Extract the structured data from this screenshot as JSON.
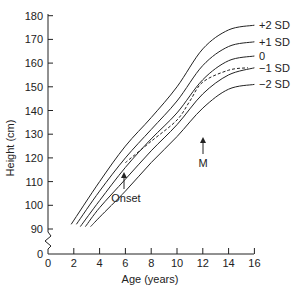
{
  "chart_data": {
    "type": "line",
    "title": "",
    "xlabel": "Age (years)",
    "ylabel": "Height (cm)",
    "xlim": [
      0,
      16
    ],
    "ylim": [
      90,
      180
    ],
    "y_axis_break": true,
    "y_zero_label": "0",
    "x_ticks": [
      0,
      2,
      4,
      6,
      8,
      10,
      12,
      14,
      16
    ],
    "y_ticks": [
      90,
      100,
      110,
      120,
      130,
      140,
      150,
      160,
      170,
      180
    ],
    "grid": false,
    "legend_position": "right end labels",
    "series": [
      {
        "name": "+2 SD",
        "style": "solid",
        "x": [
          1.8,
          4,
          6,
          8,
          10,
          12,
          14,
          16
        ],
        "values": [
          92,
          110,
          125,
          137,
          150,
          166,
          174,
          176
        ]
      },
      {
        "name": "+1 SD",
        "style": "solid",
        "x": [
          2.2,
          4,
          6,
          8,
          10,
          12,
          14,
          16
        ],
        "values": [
          92,
          106,
          120,
          132,
          144,
          159,
          167,
          169
        ]
      },
      {
        "name": "0",
        "style": "solid",
        "x": [
          2.5,
          4,
          6,
          8,
          10,
          12,
          14,
          16
        ],
        "values": [
          91,
          102,
          116,
          128,
          139,
          153,
          161,
          163
        ]
      },
      {
        "name": "−1 SD",
        "style": "solid",
        "x": [
          2.9,
          4,
          6,
          8,
          10,
          12,
          14,
          16
        ],
        "values": [
          91,
          99,
          111,
          123,
          134,
          147,
          155,
          158
        ]
      },
      {
        "name": "−2 SD",
        "style": "solid",
        "x": [
          3.3,
          4,
          6,
          8,
          10,
          12,
          14,
          16
        ],
        "values": [
          91,
          95,
          106,
          118,
          129,
          141,
          149,
          151
        ]
      },
      {
        "name": "Patient",
        "style": "dashed",
        "x": [
          6,
          8,
          10,
          11,
          12,
          14,
          15.5
        ],
        "values": [
          118,
          127,
          136,
          144,
          152,
          157,
          158
        ]
      }
    ],
    "annotations": [
      {
        "text": "Onset",
        "x": 6,
        "arrow_from_height": 101,
        "arrow_to_height": 108
      },
      {
        "text": "M",
        "x": 12,
        "arrow_from_height": 128,
        "arrow_to_height": 136
      }
    ]
  },
  "labels": {
    "xlabel": "Age (years)",
    "ylabel": "Height (cm)",
    "x_ticks": [
      "0",
      "2",
      "4",
      "6",
      "8",
      "10",
      "12",
      "14",
      "16"
    ],
    "y_ticks": [
      "90",
      "100",
      "110",
      "120",
      "130",
      "140",
      "150",
      "160",
      "170",
      "180"
    ],
    "y_zero": "0",
    "series_labels": [
      "+2 SD",
      "+1 SD",
      "0",
      "−1 SD",
      "−2 SD"
    ],
    "onset": "Onset",
    "m": "M"
  }
}
